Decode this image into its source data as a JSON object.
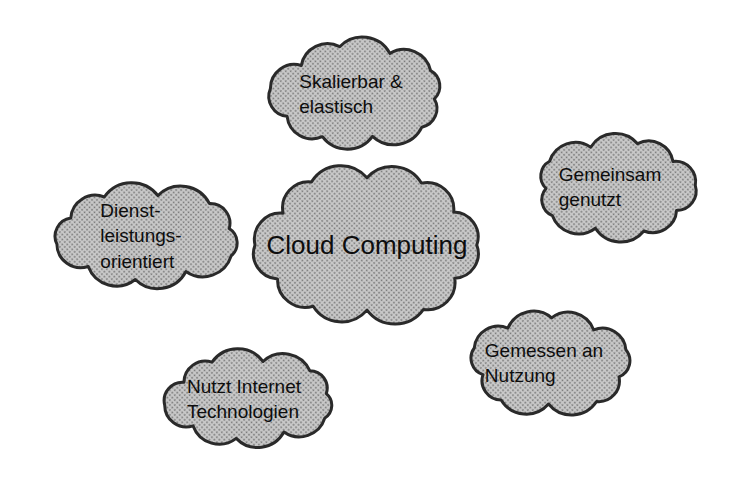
{
  "diagram": {
    "title": "Cloud Computing",
    "center": {
      "label": "Cloud Computing"
    },
    "satellites": [
      {
        "id": "skalierbar-elastisch",
        "label": "Skalierbar &\nelastisch"
      },
      {
        "id": "gemeinsam-genutzt",
        "label": "Gemeinsam\ngenutzt"
      },
      {
        "id": "dienstleistungsorientiert",
        "label": "Dienst-\nleistungs-\norientiert"
      },
      {
        "id": "nutzt-internet-technologien",
        "label": "Nutzt Internet\nTechnologien"
      },
      {
        "id": "gemessen-an-nutzung",
        "label": "Gemessen an\nNutzung"
      }
    ],
    "colors": {
      "background": "#ffffff",
      "text": "#0d0d0d",
      "cloud_stroke": "#2a2a2a",
      "cloud_fill_light": "#c9c9c9",
      "cloud_fill_dot": "#7a7a7a"
    }
  }
}
